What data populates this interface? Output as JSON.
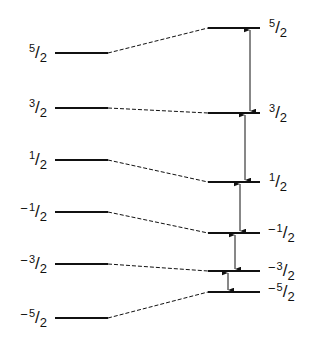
{
  "diagram": {
    "type": "energy-level-splitting",
    "line_color": "#111111",
    "left_levels": [
      {
        "sign": "",
        "num": "5",
        "den": "2",
        "y": 53
      },
      {
        "sign": "",
        "num": "3",
        "den": "2",
        "y": 108
      },
      {
        "sign": "",
        "num": "1",
        "den": "2",
        "y": 160
      },
      {
        "sign": "−",
        "num": "1",
        "den": "2",
        "y": 212
      },
      {
        "sign": "−",
        "num": "3",
        "den": "2",
        "y": 264
      },
      {
        "sign": "−",
        "num": "5",
        "den": "2",
        "y": 318
      }
    ],
    "right_levels": [
      {
        "sign": "",
        "num": "5",
        "den": "2",
        "y": 28
      },
      {
        "sign": "",
        "num": "3",
        "den": "2",
        "y": 113
      },
      {
        "sign": "",
        "num": "1",
        "den": "2",
        "y": 182
      },
      {
        "sign": "−",
        "num": "1",
        "den": "2",
        "y": 233
      },
      {
        "sign": "−",
        "num": "3",
        "den": "2",
        "y": 271
      },
      {
        "sign": "−",
        "num": "5",
        "den": "2",
        "y": 292
      }
    ],
    "transitions": [
      {
        "from": "5/2",
        "to": "3/2",
        "x": 250
      },
      {
        "from": "3/2",
        "to": "1/2",
        "x": 245
      },
      {
        "from": "1/2",
        "to": "-1/2",
        "x": 240
      },
      {
        "from": "-1/2",
        "to": "-3/2",
        "x": 235
      },
      {
        "from": "-3/2",
        "to": "-5/2",
        "x": 228
      }
    ]
  }
}
